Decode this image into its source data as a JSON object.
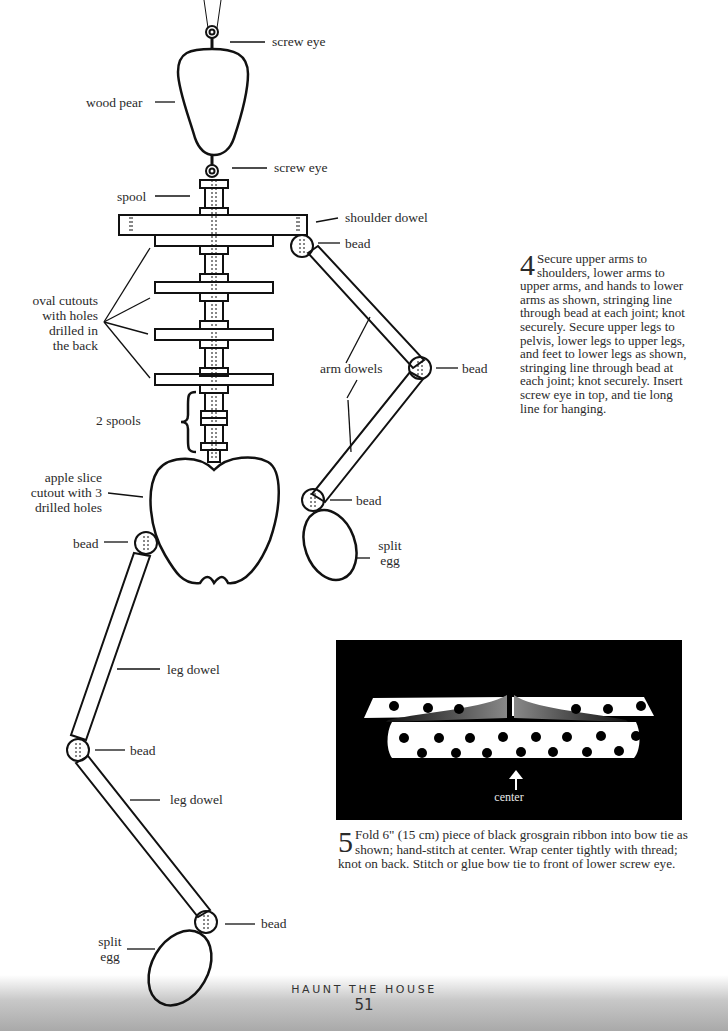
{
  "labels": {
    "screw_eye_top": "screw eye",
    "wood_pear": "wood pear",
    "screw_eye_bottom": "screw eye",
    "spool": "spool",
    "shoulder_dowel": "shoulder dowel",
    "bead_shoulder": "bead",
    "oval_cutouts": [
      "oval cutouts",
      "with holes",
      "drilled in",
      "the back"
    ],
    "arm_dowels": "arm dowels",
    "bead_elbow": "bead",
    "two_spools": "2 spools",
    "apple_slice": [
      "apple slice",
      "cutout with 3",
      "drilled holes"
    ],
    "bead_wrist": "bead",
    "split_egg_hand": [
      "split",
      "egg"
    ],
    "bead_hip": "bead",
    "leg_dowel_upper": "leg dowel",
    "bead_knee": "bead",
    "leg_dowel_lower": "leg dowel",
    "bead_ankle": "bead",
    "split_egg_foot": [
      "split",
      "egg"
    ]
  },
  "steps": {
    "step4": {
      "number": "4",
      "text": "Secure upper arms to shoulders, lower arms to upper arms, and hands to lower arms as shown, stringing line through bead at each joint; knot securely. Secure upper legs to pelvis, lower legs to upper legs, and feet to lower legs as shown, stringing line through bead at each joint; knot securely. Insert screw eye in top, and tie long line for hanging."
    },
    "step5": {
      "number": "5",
      "text": "Fold 6\" (15 cm) piece of black grosgrain ribbon into bow tie as shown; hand-stitch at center. Wrap center tightly with thread; knot on back. Stitch or glue bow tie to front of lower screw eye."
    }
  },
  "bow_figure": {
    "center_label": "center",
    "background": "#000000"
  },
  "footer": {
    "title": "HAUNT THE HOUSE",
    "page_number": "51"
  }
}
